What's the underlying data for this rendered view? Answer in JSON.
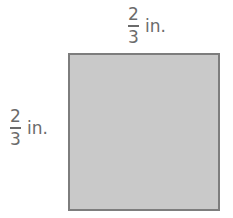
{
  "figure": {
    "shape": "square",
    "fill_color": "#c9c9c9",
    "border_color": "#7d7d7d",
    "text_color": "#6b6b6b",
    "top_label": {
      "numerator": "2",
      "denominator": "3",
      "unit": "in."
    },
    "left_label": {
      "numerator": "2",
      "denominator": "3",
      "unit": "in."
    }
  }
}
